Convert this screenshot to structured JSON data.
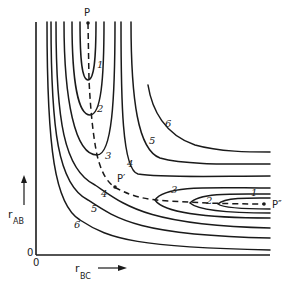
{
  "figure": {
    "type": "potential-energy-contour-diagram",
    "axes": {
      "y_label_main": "r",
      "y_label_sub": "AB",
      "x_label_main": "r",
      "x_label_sub": "BC",
      "origin_y": "0",
      "origin_x": "0"
    },
    "points": {
      "P": "P",
      "P_prime": "P′",
      "P_double_prime": "P″"
    },
    "contour_labels": {
      "valley_ab": [
        "1",
        "2",
        "3"
      ],
      "inner_4": "4",
      "inner_5": "5",
      "inner_6": "6",
      "outer_4": "4",
      "outer_5": "5",
      "outer_6": "6",
      "valley_bc": [
        "3",
        "2",
        "1"
      ]
    }
  }
}
